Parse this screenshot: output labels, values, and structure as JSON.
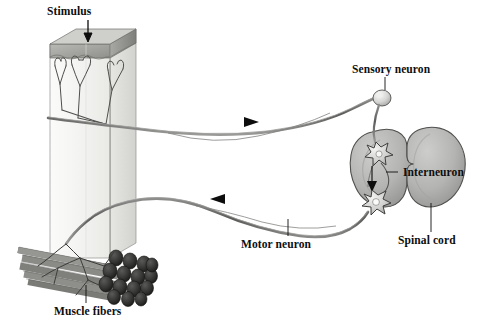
{
  "figure": {
    "width": 491,
    "height": 326,
    "background_color": "#ffffff"
  },
  "labels": {
    "stimulus": "Stimulus",
    "sensory_neuron": "Sensory neuron",
    "interneuron": "Interneuron",
    "spinal_cord": "Spinal cord",
    "motor_neuron": "Motor neuron",
    "muscle_fibers": "Muscle fibers"
  },
  "colors": {
    "ink": "#0d0d0d",
    "outline": "#4a4a4a",
    "nerve": "#6e6e6e",
    "skin_fill": "#f2f2f0",
    "skin_top": "#9a9a98",
    "cord_fill": "#b3b3b1",
    "cord_shade": "#8c8c8a",
    "muscle_fill": "#7d7d7b",
    "muscle_dark": "#2b2b2b",
    "soma_fill": "#d8d8d6"
  },
  "structures": [
    {
      "name": "skin-block",
      "description": "Cut block of skin with sensory receptor endings at the surface"
    },
    {
      "name": "stimulus-arrow",
      "description": "Vertical arrow pointing down onto skin surface"
    },
    {
      "name": "sensory-axon",
      "description": "Afferent fiber running right from skin to spinal cord"
    },
    {
      "name": "sensory-direction-arrow",
      "description": "Arrowhead pointing right along sensory axon"
    },
    {
      "name": "sensory-soma",
      "description": "Dorsal root ganglion cell body"
    },
    {
      "name": "spinal-cord",
      "description": "Cross section of spinal cord gray matter, butterfly outline"
    },
    {
      "name": "interneuron-soma-upper",
      "description": "Star shaped interneuron cell body"
    },
    {
      "name": "interneuron-soma-lower",
      "description": "Star shaped motor neuron cell body"
    },
    {
      "name": "synapse-arrow",
      "description": "Arrow pointing down from interneuron to motor neuron"
    },
    {
      "name": "motor-axon",
      "description": "Efferent fiber running left from spinal cord to muscle"
    },
    {
      "name": "motor-direction-arrow",
      "description": "Arrowhead pointing left along motor axon"
    },
    {
      "name": "muscle-bundle",
      "description": "Bundle of cut muscle fibers innervated by motor endings"
    }
  ]
}
